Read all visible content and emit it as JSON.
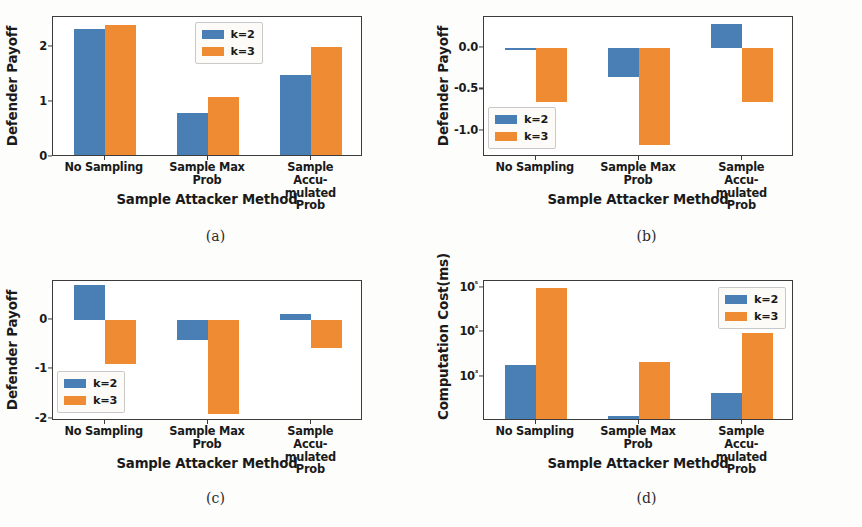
{
  "figure": {
    "panels": [
      {
        "caption": "(a)",
        "ylabel": "Defender Payoff",
        "xlabel": "Sample Attacker Method",
        "legend_position": "upper-center",
        "chart_data": {
          "type": "bar",
          "title": "",
          "xlabel": "Sample Attacker Method",
          "ylabel": "Defender Payoff",
          "categories": [
            "No Sampling",
            "Sample Max\nProb",
            "Sample Accu-\nmulated Prob"
          ],
          "series": [
            {
              "name": "k=2",
              "color": "#4a7fb5",
              "values": [
                2.33,
                0.8,
                1.5
              ]
            },
            {
              "name": "k=3",
              "color": "#ef8b33",
              "values": [
                2.4,
                1.1,
                2.0
              ]
            }
          ],
          "yticks": [
            "0",
            "1",
            "2"
          ],
          "ytickvalues": [
            0,
            1,
            2
          ],
          "ylim": [
            0,
            2.55
          ],
          "yscale": "linear",
          "grid": false,
          "legend": [
            "k=2",
            "k=3"
          ]
        }
      },
      {
        "caption": "(b)",
        "ylabel": "Defender Payoff",
        "xlabel": "Sample Attacker Method",
        "legend_position": "lower-left",
        "chart_data": {
          "type": "bar",
          "title": "",
          "xlabel": "Sample Attacker Method",
          "ylabel": "Defender Payoff",
          "categories": [
            "No Sampling",
            "Sample Max\nProb",
            "Sample Accu-\nmulated Prob"
          ],
          "series": [
            {
              "name": "k=2",
              "color": "#4a7fb5",
              "values": [
                -0.02,
                -0.35,
                0.3
              ]
            },
            {
              "name": "k=3",
              "color": "#ef8b33",
              "values": [
                -0.65,
                -1.17,
                -0.65
              ]
            }
          ],
          "yticks": [
            "0.0",
            "-0.5",
            "-1.0"
          ],
          "ytickvalues": [
            0.0,
            -0.5,
            -1.0
          ],
          "ylim": [
            -1.32,
            0.38
          ],
          "yscale": "linear",
          "grid": false,
          "legend": [
            "k=2",
            "k=3"
          ]
        }
      },
      {
        "caption": "(c)",
        "ylabel": "Defender Payoff",
        "xlabel": "Sample Attacker Method",
        "legend_position": "lower-left",
        "chart_data": {
          "type": "bar",
          "title": "",
          "xlabel": "Sample Attacker Method",
          "ylabel": "Defender Payoff",
          "categories": [
            "No Sampling",
            "Sample Max\nProb",
            "Sample Accu-\nmulated Prob"
          ],
          "series": [
            {
              "name": "k=2",
              "color": "#4a7fb5",
              "values": [
                0.7,
                -0.42,
                0.12
              ]
            },
            {
              "name": "k=3",
              "color": "#ef8b33",
              "values": [
                -0.9,
                -1.9,
                -0.58
              ]
            }
          ],
          "yticks": [
            "0",
            "-1",
            "-2"
          ],
          "ytickvalues": [
            0,
            -1,
            -2
          ],
          "ylim": [
            -2.05,
            0.78
          ],
          "yscale": "linear",
          "grid": false,
          "legend": [
            "k=2",
            "k=3"
          ]
        }
      },
      {
        "caption": "(d)",
        "ylabel": "Computation Cost(ms)",
        "xlabel": "Sample Attacker Method",
        "legend_position": "upper-right",
        "chart_data": {
          "type": "bar",
          "title": "",
          "xlabel": "Sample Attacker Method",
          "ylabel": "Computation Cost(ms)",
          "categories": [
            "No Sampling",
            "Sample Max\nProb",
            "Sample Accu-\nmulated Prob"
          ],
          "series": [
            {
              "name": "k=2",
              "color": "#4a7fb5",
              "values": [
                1800,
                130,
                420
              ]
            },
            {
              "name": "k=3",
              "color": "#ef8b33",
              "values": [
                100000,
                2100,
                9500
              ]
            }
          ],
          "yticks": [
            "10⁵",
            "10⁴",
            "10³"
          ],
          "ytickvalues": [
            100000,
            10000,
            1000
          ],
          "ylim": [
            100,
            140000
          ],
          "yscale": "log",
          "grid": false,
          "legend": [
            "k=2",
            "k=3"
          ]
        }
      }
    ],
    "series_names": [
      "k=2",
      "k=3"
    ],
    "colors": {
      "k2": "#4a7fb5",
      "k3": "#ef8b33"
    }
  }
}
